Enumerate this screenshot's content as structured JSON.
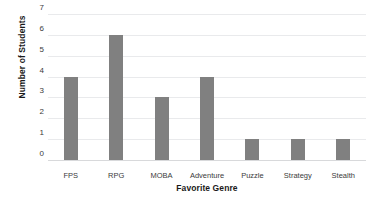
{
  "chart_data": {
    "type": "bar",
    "title": "",
    "xlabel": "Favorite Genre",
    "ylabel": "Number of Students",
    "categories": [
      "FPS",
      "RPG",
      "MOBA",
      "Adventure",
      "Puzzle",
      "Strategy",
      "Stealth"
    ],
    "values": [
      4,
      6,
      3,
      4,
      1,
      1,
      1
    ],
    "ylim": [
      0,
      7
    ],
    "ytick_labels": [
      "7",
      "6",
      "5",
      "4",
      "3",
      "2",
      "1",
      "0"
    ],
    "ytick_values": [
      7,
      6,
      5,
      4,
      3,
      2,
      1,
      0
    ],
    "grid": true,
    "legend": "none",
    "bar_color": "#808080",
    "gridline_color": "#e9eaec",
    "axis_line_color": "#d8d9db",
    "background_color": "#ffffff"
  }
}
